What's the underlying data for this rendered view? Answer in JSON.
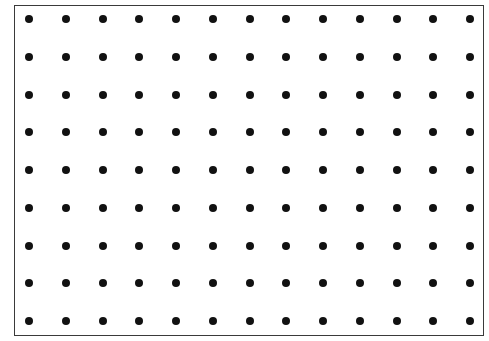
{
  "grid": {
    "columns": 13,
    "rows": 9,
    "origin_x": 29,
    "origin_y": 19,
    "spacing_x": 36.75,
    "spacing_y": 37.75,
    "dot_diameter": 8,
    "dot_color": "#111111",
    "border_color": "#3a3a3a"
  }
}
